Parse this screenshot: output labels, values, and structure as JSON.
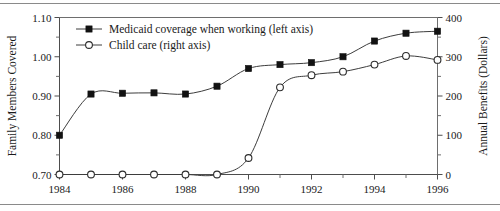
{
  "chart_data": {
    "type": "line",
    "title": "",
    "subtitle": "",
    "xlabel": "",
    "ylabel": "Family Members Covered",
    "y2label": "Annual Benefits (Dollars)",
    "x": [
      1984,
      1985,
      1986,
      1987,
      1988,
      1989,
      1990,
      1991,
      1992,
      1993,
      1994,
      1995,
      1996
    ],
    "xlim": [
      1984,
      1996
    ],
    "xticks": [
      1984,
      1985,
      1986,
      1987,
      1988,
      1989,
      1990,
      1991,
      1992,
      1993,
      1994,
      1995,
      1996
    ],
    "xticklabels": [
      "1984",
      "",
      "1986",
      "",
      "1988",
      "",
      "1990",
      "",
      "1992",
      "",
      "1994",
      "",
      "1996"
    ],
    "xticklabels_shown": [
      "1984",
      "1986",
      "1988",
      "1990",
      "1992",
      "1994",
      "1996"
    ],
    "ylim": [
      0.7,
      1.1
    ],
    "yticks": [
      0.7,
      0.8,
      0.9,
      1.0,
      1.1
    ],
    "yticklabels": [
      "0.70",
      "0.80",
      "0.90",
      "1.00",
      "1.10"
    ],
    "y_minor_ticks": [
      0.75,
      0.85,
      0.95,
      1.05
    ],
    "y2lim": [
      0,
      400
    ],
    "y2ticks": [
      0,
      100,
      200,
      300,
      400
    ],
    "y2ticklabels": [
      "0",
      "100",
      "200",
      "300",
      "400"
    ],
    "y2_minor_ticks": [
      50,
      150,
      250,
      350
    ],
    "grid": false,
    "legend_position": "upper-left-inside",
    "series": [
      {
        "name": "Medicaid coverage when working (left axis)",
        "axis": "left",
        "marker": "filled-square",
        "values": [
          0.8,
          0.905,
          0.907,
          0.908,
          0.905,
          0.925,
          0.97,
          0.98,
          0.985,
          1.0,
          1.04,
          1.06,
          1.065
        ]
      },
      {
        "name": "Child care (right axis)",
        "axis": "right",
        "marker": "open-circle",
        "values": [
          0,
          0,
          0,
          0,
          0,
          0,
          42,
          222,
          253,
          262,
          280,
          302,
          292
        ]
      }
    ]
  },
  "legend": {
    "entries": [
      {
        "label": "Medicaid coverage when working (left axis)",
        "marker": "filled-square"
      },
      {
        "label": "Child care (right axis)",
        "marker": "open-circle"
      }
    ]
  },
  "colors": {
    "series_line": "#3d3d3d",
    "marker_fill": "#121212",
    "marker_open_fill": "#ffffff",
    "axis": "#4d4d4d",
    "text": "#1a1a1a",
    "background": "#ffffff",
    "rule": "#8a8a8a"
  }
}
